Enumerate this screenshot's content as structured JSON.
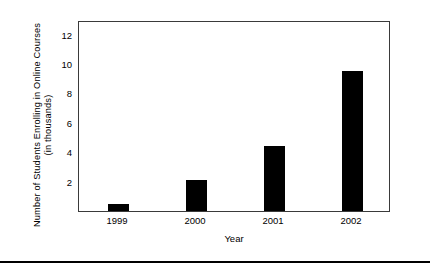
{
  "chart_data": {
    "type": "bar",
    "title": "",
    "xlabel": "Year",
    "ylabel": "Number of Students Enrolling in Online Courses (in thousands)",
    "ylabel_lines": [
      "Number of Students Enrolling in Online Courses",
      "(in thousands)"
    ],
    "categories": [
      "1999",
      "2000",
      "2001",
      "2002"
    ],
    "values": [
      0.5,
      2.1,
      4.4,
      9.5
    ],
    "series": [
      {
        "name": "Students enrolling in online courses",
        "values": [
          0.5,
          2.1,
          4.4,
          9.5
        ]
      }
    ],
    "ylim": [
      0,
      13
    ],
    "yticks": [
      2,
      4,
      6,
      8,
      10,
      12
    ],
    "ytick_labels": [
      "2",
      "4",
      "6",
      "8",
      "10",
      "12"
    ],
    "grid": false,
    "legend": null,
    "legend_position": "none",
    "bar_color": "#000000",
    "axis_color": "#3a3a3a",
    "annotations": []
  }
}
